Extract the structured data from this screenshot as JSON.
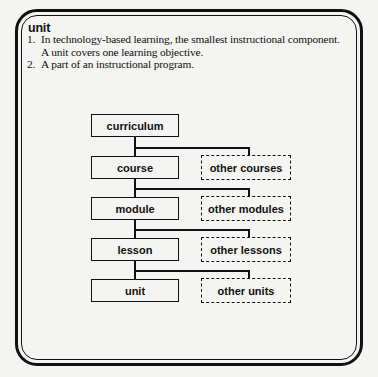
{
  "entry": {
    "term": "unit",
    "definitions": [
      {
        "number": "1.",
        "text": "In technology-based learning, the smallest instructional component. A unit covers one learning objective."
      },
      {
        "number": "2.",
        "text": "A part of an instructional program."
      }
    ]
  },
  "diagram": {
    "type": "hierarchy",
    "levels": [
      {
        "label": "curriculum",
        "sibling": null
      },
      {
        "label": "course",
        "sibling": "other courses"
      },
      {
        "label": "module",
        "sibling": "other modules"
      },
      {
        "label": "lesson",
        "sibling": "other lessons"
      },
      {
        "label": "unit",
        "sibling": "other units"
      }
    ]
  }
}
